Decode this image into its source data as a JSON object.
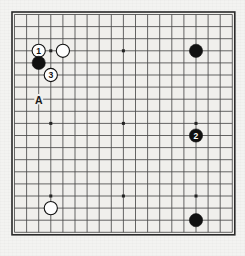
{
  "diagram": {
    "type": "go-board-diagram",
    "board_size": 19,
    "title": "",
    "board_color": "#f0efec",
    "line_color": "#4a4a4a",
    "border_color": "#2a2a2a",
    "black_color": "#111111",
    "white_color": "#fdfdfd",
    "label_color": "#1a1a1a",
    "star_points": [
      {
        "col": 4,
        "row": 4
      },
      {
        "col": 10,
        "row": 4
      },
      {
        "col": 16,
        "row": 4
      },
      {
        "col": 4,
        "row": 10
      },
      {
        "col": 10,
        "row": 10
      },
      {
        "col": 16,
        "row": 10
      },
      {
        "col": 4,
        "row": 16
      },
      {
        "col": 10,
        "row": 16
      },
      {
        "col": 16,
        "row": 16
      }
    ],
    "stones": [
      {
        "id": "move-1",
        "color": "white",
        "col": 3,
        "row": 4,
        "label": "1"
      },
      {
        "id": "white-corner-top",
        "color": "white",
        "col": 5,
        "row": 4,
        "label": ""
      },
      {
        "id": "black-upper-left",
        "color": "black",
        "col": 3,
        "row": 5,
        "label": ""
      },
      {
        "id": "move-3",
        "color": "white",
        "col": 4,
        "row": 6,
        "label": "3"
      },
      {
        "id": "black-upper-right",
        "color": "black",
        "col": 16,
        "row": 4,
        "label": ""
      },
      {
        "id": "move-2",
        "color": "black",
        "col": 16,
        "row": 11,
        "label": "2"
      },
      {
        "id": "white-lower-left",
        "color": "white",
        "col": 4,
        "row": 17,
        "label": ""
      },
      {
        "id": "black-lower-right",
        "color": "black",
        "col": 16,
        "row": 18,
        "label": ""
      }
    ],
    "point_labels": [
      {
        "id": "point-a",
        "text": "A",
        "col": 3,
        "row": 8
      }
    ]
  }
}
